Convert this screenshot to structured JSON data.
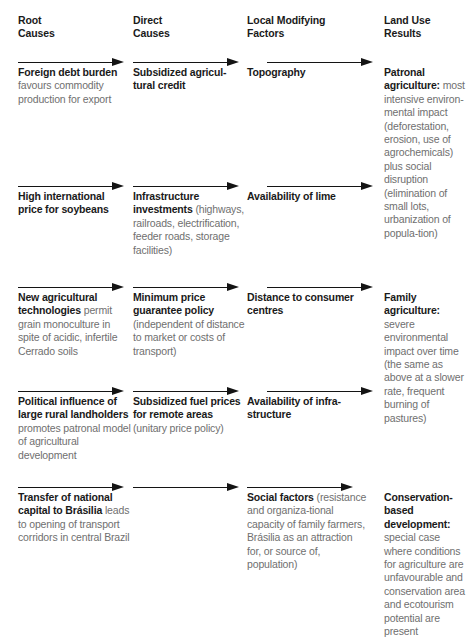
{
  "diagram": {
    "columns": [
      {
        "id": "root-causes",
        "header": "Root\nCauses"
      },
      {
        "id": "direct-causes",
        "header": "Direct\nCauses"
      },
      {
        "id": "local-modifying-factors",
        "header": "Local Modifying\nFactors"
      },
      {
        "id": "land-use-results",
        "header": "Land Use\nResults"
      }
    ],
    "rows": [
      {
        "id": "row-1",
        "cells": [
          {
            "column": "root-causes",
            "bold": "Foreign debt burden",
            "text": " favours commodity production for export"
          },
          {
            "column": "direct-causes",
            "bold": "Subsidized agricul-​tural credit",
            "text": ""
          },
          {
            "column": "local-modifying-factors",
            "bold": "Topography",
            "text": ""
          },
          {
            "column": "land-use-results",
            "bold": "Patronal agriculture:",
            "text": " most intensive environ-mental impact (deforestation, erosion, use of agrochemicals) plus social disruption (elimination of small lots, urbanization of popula-tion)"
          }
        ]
      },
      {
        "id": "row-2",
        "cells": [
          {
            "column": "root-causes",
            "bold": "High international price for soybeans",
            "text": ""
          },
          {
            "column": "direct-causes",
            "bold": "Infrastructure investments",
            "text": " (highways, railroads, electrification, feeder roads, storage facilities)"
          },
          {
            "column": "local-modifying-factors",
            "bold": "Availability of lime",
            "text": ""
          },
          {
            "column": "land-use-results",
            "bold": "",
            "text": ""
          }
        ]
      },
      {
        "id": "row-3",
        "cells": [
          {
            "column": "root-causes",
            "bold": "New agricultural technologies",
            "text": " permit grain monoculture in spite of acidic, infertile Cerrado soils"
          },
          {
            "column": "direct-causes",
            "bold": "Minimum price guarantee policy",
            "text": " (independent of distance to market or costs of transport)"
          },
          {
            "column": "local-modifying-factors",
            "bold": "Distance to consumer centres",
            "text": ""
          },
          {
            "column": "land-use-results",
            "bold": "Family agriculture:",
            "text": " severe environmental impact over time (the same as above at a slower rate, frequent burning of pastures)"
          }
        ]
      },
      {
        "id": "row-4",
        "cells": [
          {
            "column": "root-causes",
            "bold": "Political influence of large rural landholders",
            "text": " promotes patronal model of agricultural development"
          },
          {
            "column": "direct-causes",
            "bold": "Subsidized fuel prices for remote areas",
            "text": " (unitary price policy)"
          },
          {
            "column": "local-modifying-factors",
            "bold": "Availability of infra-structure",
            "text": ""
          },
          {
            "column": "land-use-results",
            "bold": "",
            "text": ""
          }
        ]
      },
      {
        "id": "row-5",
        "cells": [
          {
            "column": "root-causes",
            "bold": "Transfer of national capital to Brásilia",
            "text": " leads to opening of transport corridors in central Brazil"
          },
          {
            "column": "direct-causes",
            "bold": "",
            "text": ""
          },
          {
            "column": "local-modifying-factors",
            "bold": "Social factors",
            "text": " (resistance and organiza-tional capacity of family farmers, Brásilia as an attraction for, or source of, population)"
          },
          {
            "column": "land-use-results",
            "bold": "Conservation-based development:",
            "text": " special case where conditions for agriculture are unfavourable and conservation area and ecotourism potential are present"
          }
        ]
      }
    ],
    "arrows": {
      "label": "flow-arrow",
      "count_per_row": 3,
      "rows_with_arrows": [
        "row-1",
        "row-2",
        "row-3",
        "row-4",
        "row-5"
      ],
      "direction": "right"
    },
    "colors": {
      "bold_text": "#1a1a1a",
      "body_text": "#6f6f6f",
      "arrow": "#141414",
      "background": "#ffffff"
    }
  }
}
